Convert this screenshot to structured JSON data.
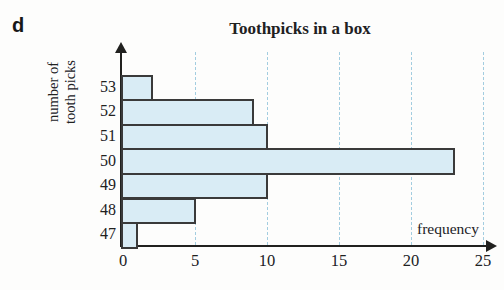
{
  "page": {
    "corner_label": "d"
  },
  "chart_data": {
    "type": "bar",
    "orientation": "horizontal",
    "title": "Toothpicks in a box",
    "xlabel": "frequency",
    "ylabel": "number of tooth picks",
    "ylabel_lines": [
      "number of",
      "tooth picks"
    ],
    "categories": [
      "53",
      "52",
      "51",
      "50",
      "49",
      "48",
      "47"
    ],
    "values": [
      2,
      9,
      10,
      23,
      10,
      5,
      1
    ],
    "x_ticks": [
      0,
      5,
      10,
      15,
      20,
      25
    ],
    "xlim": [
      0,
      25
    ],
    "grid": "vertical-dashed-gridlines-at-x-ticks",
    "legend": "none",
    "colors": {
      "bar_fill": "#d9ecf5",
      "bar_border": "#3a3a3a",
      "gridline": "#a3cde0",
      "axis": "#21211f",
      "text": "#21211f"
    }
  }
}
